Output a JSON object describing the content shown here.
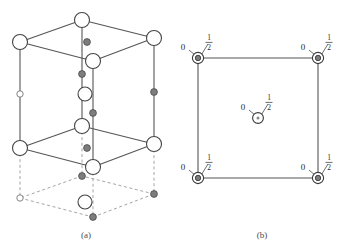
{
  "figure": {
    "panels": [
      {
        "id": "a",
        "caption": "(a)",
        "caption_x": 86,
        "caption_y": 238,
        "type": "unit-cell-perspective",
        "description": "Perspective view of a stacked unit cell with solid upper box and dashed lower box"
      },
      {
        "id": "b",
        "caption": "(b)",
        "caption_x": 262,
        "caption_y": 238,
        "type": "projection-square",
        "description": "Plan projection square with labelled atom heights"
      }
    ],
    "height_labels": {
      "zero": "0",
      "half_numerator": "1",
      "half_denominator": "2"
    },
    "colors": {
      "line": "#555555",
      "dashed_line": "#9a9a9a",
      "atom_large_fill": "#ffffff",
      "atom_large_stroke": "#444444",
      "atom_small_fill": "#7d7d7d",
      "atom_small_stroke": "#4a4a4a",
      "atom_open_fill": "#ffffff",
      "atom_open_stroke": "#777777",
      "text": "#2b2b2b",
      "caption": "#4a4a4a",
      "background": "#ffffff"
    },
    "panel_a": {
      "top_face": {
        "back_x": 82,
        "back_y": 20,
        "left_x": 20,
        "left_y": 42,
        "front_x": 93,
        "front_y": 61,
        "right_x": 154,
        "right_y": 38
      },
      "mid_face": {
        "back_x": 82,
        "back_y": 126,
        "left_x": 20,
        "left_y": 148,
        "front_x": 93,
        "front_y": 167,
        "right_x": 154,
        "right_y": 144
      },
      "bottom_face": {
        "back_x": 82,
        "back_y": 176,
        "left_x": 20,
        "left_y": 198,
        "front_x": 93,
        "front_y": 217,
        "right_x": 154,
        "right_y": 194
      },
      "atoms_large": [
        {
          "x": 82,
          "y": 20,
          "r": 7.5,
          "name": "top-back-corner"
        },
        {
          "x": 20,
          "y": 42,
          "r": 7.5,
          "name": "top-left-corner"
        },
        {
          "x": 93,
          "y": 61,
          "r": 7.5,
          "name": "top-front-corner"
        },
        {
          "x": 154,
          "y": 38,
          "r": 7.5,
          "name": "top-right-corner"
        },
        {
          "x": 82,
          "y": 126,
          "r": 7.5,
          "name": "mid-back-corner"
        },
        {
          "x": 20,
          "y": 148,
          "r": 7.5,
          "name": "mid-left-corner"
        },
        {
          "x": 93,
          "y": 167,
          "r": 7.5,
          "name": "mid-front-corner"
        },
        {
          "x": 154,
          "y": 144,
          "r": 7.5,
          "name": "mid-right-corner"
        },
        {
          "x": 85,
          "y": 94,
          "r": 7.0,
          "name": "interior-mid-atom"
        },
        {
          "x": 85,
          "y": 202,
          "r": 7.0,
          "name": "interior-lower-atom"
        }
      ],
      "atoms_small": [
        {
          "x": 87,
          "y": 42,
          "r": 3.4,
          "name": "top-face-interior-dot"
        },
        {
          "x": 87,
          "y": 148,
          "r": 3.4,
          "name": "mid-face-interior-dot"
        },
        {
          "x": 82,
          "y": 74,
          "r": 3.4,
          "name": "back-edge-mid-dot"
        },
        {
          "x": 154,
          "y": 92,
          "r": 3.4,
          "name": "right-edge-mid-dot"
        },
        {
          "x": 93,
          "y": 113,
          "r": 3.4,
          "name": "front-edge-mid-dot"
        },
        {
          "x": 82,
          "y": 176,
          "r": 3.4,
          "name": "lower-back-corner-dot"
        },
        {
          "x": 154,
          "y": 194,
          "r": 3.4,
          "name": "lower-right-corner-dot"
        },
        {
          "x": 93,
          "y": 217,
          "r": 3.4,
          "name": "lower-front-corner-dot"
        }
      ],
      "atoms_open": [
        {
          "x": 20,
          "y": 94,
          "r": 3.2,
          "name": "left-edge-mid-open"
        },
        {
          "x": 20,
          "y": 198,
          "r": 3.2,
          "name": "lower-left-corner-open"
        }
      ]
    },
    "panel_b": {
      "square": {
        "left": 198,
        "top": 58,
        "right": 318,
        "bottom": 178
      },
      "corner_atoms": [
        {
          "x": 198,
          "y": 58,
          "name": "corner-top-left",
          "label_zero_x": 183,
          "label_zero_y": 48,
          "frac_x": 207,
          "frac_y": 44
        },
        {
          "x": 318,
          "y": 58,
          "name": "corner-top-right",
          "label_zero_x": 303,
          "label_zero_y": 48,
          "frac_x": 327,
          "frac_y": 44
        },
        {
          "x": 198,
          "y": 178,
          "name": "corner-bottom-left",
          "label_zero_x": 183,
          "label_zero_y": 168,
          "frac_x": 207,
          "frac_y": 164
        },
        {
          "x": 318,
          "y": 178,
          "name": "corner-bottom-right",
          "label_zero_x": 303,
          "label_zero_y": 168,
          "frac_x": 327,
          "frac_y": 164
        }
      ],
      "center_atom": {
        "x": 258,
        "y": 118,
        "name": "center-atom",
        "label_zero_x": 243,
        "label_zero_y": 108,
        "frac_x": 267,
        "frac_y": 104
      }
    }
  }
}
